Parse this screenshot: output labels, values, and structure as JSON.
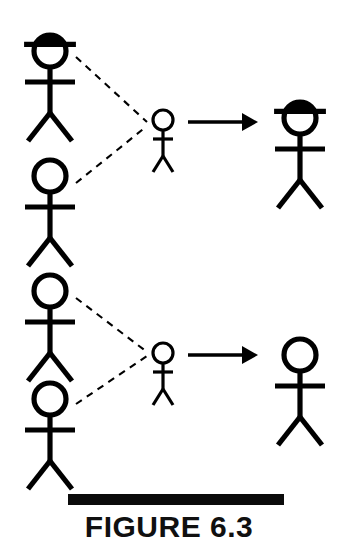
{
  "figure": {
    "caption": "FIGURE 6.3",
    "background_color": "#ffffff",
    "ink_color": "#000000",
    "caption_bar_color": "#0b0b0b",
    "width": 338,
    "height": 549
  },
  "scenes": [
    {
      "id": "scene-top",
      "name": "top-scene-with-hats",
      "label": "Top scene: two observers, one wearing a hat, converge on a target figure that is transformed into a hatted figure",
      "observers": [
        {
          "id": "observer-top-upper",
          "name": "stick-figure-observer-hatted",
          "has_hat": true,
          "size": "large",
          "head_center_x": 50,
          "head_center_y": 51,
          "head_radius": 16
        },
        {
          "id": "observer-top-lower",
          "name": "stick-figure-observer-plain",
          "has_hat": false,
          "size": "large",
          "head_center_x": 50,
          "head_center_y": 176,
          "head_radius": 16
        }
      ],
      "connectors": [
        {
          "id": "connector-top-upper",
          "name": "dashed-influence-line-upper",
          "style": "dashed",
          "from_x": 76,
          "from_y": 57,
          "to_x": 147,
          "to_y": 122
        },
        {
          "id": "connector-top-lower",
          "name": "dashed-influence-line-lower",
          "style": "dashed",
          "from_x": 76,
          "from_y": 183,
          "to_x": 147,
          "to_y": 126
        }
      ],
      "subject": {
        "id": "subject-top",
        "name": "stick-figure-subject-small",
        "has_hat": false,
        "size": "small",
        "head_center_x": 163,
        "head_center_y": 120,
        "head_radius": 10
      },
      "arrow": {
        "id": "arrow-top",
        "name": "transformation-arrow",
        "from_x": 188,
        "from_y": 122,
        "to_x": 258,
        "to_y": 122
      },
      "result": {
        "id": "result-top",
        "name": "stick-figure-result-hatted",
        "has_hat": true,
        "size": "large",
        "head_center_x": 300,
        "head_center_y": 118,
        "head_radius": 16
      }
    },
    {
      "id": "scene-bottom",
      "name": "bottom-scene-no-hats",
      "label": "Bottom scene: two plain observers converge on a target figure that remains a plain figure",
      "observers": [
        {
          "id": "observer-bottom-upper",
          "name": "stick-figure-observer-plain",
          "has_hat": false,
          "size": "large",
          "head_center_x": 50,
          "head_center_y": 291,
          "head_radius": 16
        },
        {
          "id": "observer-bottom-lower",
          "name": "stick-figure-observer-plain",
          "has_hat": false,
          "size": "large",
          "head_center_x": 50,
          "head_center_y": 399,
          "head_radius": 16
        }
      ],
      "connectors": [
        {
          "id": "connector-bottom-upper",
          "name": "dashed-influence-line-upper",
          "style": "dashed",
          "from_x": 76,
          "from_y": 298,
          "to_x": 147,
          "to_y": 352
        },
        {
          "id": "connector-bottom-lower",
          "name": "dashed-influence-line-lower",
          "style": "dashed",
          "from_x": 76,
          "from_y": 404,
          "to_x": 147,
          "to_y": 356
        }
      ],
      "subject": {
        "id": "subject-bottom",
        "name": "stick-figure-subject-small",
        "has_hat": false,
        "size": "small",
        "head_center_x": 163,
        "head_center_y": 353,
        "head_radius": 10
      },
      "arrow": {
        "id": "arrow-bottom",
        "name": "transformation-arrow",
        "from_x": 188,
        "from_y": 355,
        "to_x": 258,
        "to_y": 355
      },
      "result": {
        "id": "result-bottom",
        "name": "stick-figure-result-plain",
        "has_hat": false,
        "size": "large",
        "head_center_x": 300,
        "head_center_y": 355,
        "head_radius": 16
      }
    }
  ]
}
